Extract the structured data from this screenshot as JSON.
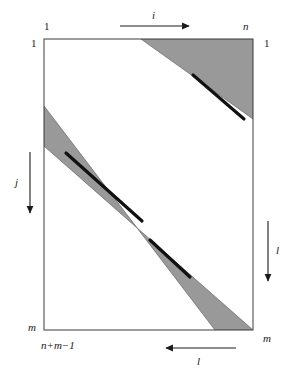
{
  "figure": {
    "colors": {
      "band_fill": "#999999",
      "band_stroke": "#6e6e6e",
      "box_stroke": "#4d4d4d",
      "line_black": "#111111",
      "background": "#ffffff",
      "text": "#1a1a1a"
    },
    "box": {
      "left": 44,
      "top": 39,
      "right": 253,
      "bottom": 330
    },
    "labels": {
      "top_left_index": "1",
      "left_row_index": "1",
      "top_axis": "i",
      "top_right_index": "n",
      "right_top_index": "1",
      "left_axis": "j",
      "right_axis": "l",
      "bottom_left_index": "m",
      "bottom_left_diag": "n+m−1",
      "bottom_axis": "l",
      "bottom_right_index": "m"
    },
    "arrows": [
      {
        "name": "i-arrow",
        "direction": "right",
        "x1": 120,
        "y1": 26,
        "x2": 189,
        "y2": 26
      },
      {
        "name": "j-arrow",
        "direction": "down",
        "x1": 30,
        "y1": 152,
        "x2": 30,
        "y2": 213
      },
      {
        "name": "l-right-arrow",
        "direction": "down",
        "x1": 268,
        "y1": 221,
        "x2": 268,
        "y2": 281
      },
      {
        "name": "l-bottom-arrow",
        "direction": "left",
        "x1": 236,
        "y1": 348,
        "x2": 166,
        "y2": 348
      }
    ],
    "bands": [
      {
        "name": "upper-diagonal-band",
        "points": "185,39 253,39 253,119 141,39"
      },
      {
        "name": "lower-diagonal-band",
        "points": "44,106 44,146 253,330 215,330"
      }
    ],
    "band_segments": [
      {
        "name": "upper-band-segment",
        "x1": 193,
        "y1": 75,
        "x2": 244,
        "y2": 119
      },
      {
        "name": "lower-band-segment-upper",
        "x1": 66,
        "y1": 153,
        "x2": 142,
        "y2": 221
      },
      {
        "name": "lower-band-segment-lower",
        "x1": 150,
        "y1": 240,
        "x2": 190,
        "y2": 277
      }
    ]
  }
}
